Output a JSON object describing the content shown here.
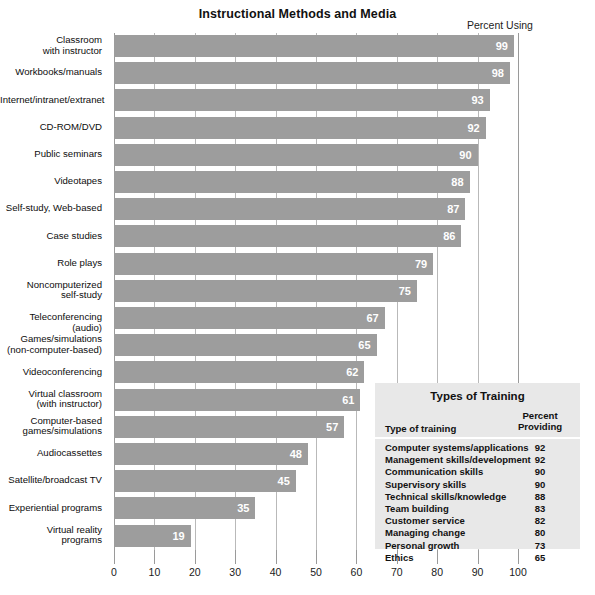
{
  "chart_data": {
    "type": "bar",
    "orientation": "horizontal",
    "title": "Instructional Methods and Media",
    "axis_note": "Percent Using",
    "xlabel": "",
    "ylabel": "",
    "xlim": [
      0,
      100
    ],
    "xticks": [
      0,
      10,
      20,
      30,
      40,
      50,
      60,
      70,
      80,
      90,
      100
    ],
    "xtick_labels": [
      "0",
      "10",
      "20",
      "30",
      "40",
      "50",
      "60",
      "70",
      "80",
      "90",
      "100"
    ],
    "grid": "vertical",
    "legend_position": "inside-bottom-right",
    "bar_color": "#9d9d9d",
    "categories": [
      "Classroom\nwith instructor",
      "Workbooks/manuals",
      "Internet/intranet/extranet",
      "CD-ROM/DVD",
      "Public seminars",
      "Videotapes",
      "Self-study, Web-based",
      "Case studies",
      "Role plays",
      "Noncomputerized\nself-study",
      "Teleconferencing (audio)",
      "Games/simulations\n(non-computer-based)",
      "Videoconferencing",
      "Virtual classroom\n(with instructor)",
      "Computer-based\ngames/simulations",
      "Audiocassettes",
      "Satellite/broadcast TV",
      "Experiential programs",
      "Virtual reality\nprograms"
    ],
    "values": [
      99,
      98,
      93,
      92,
      90,
      88,
      87,
      86,
      79,
      75,
      67,
      65,
      62,
      61,
      57,
      48,
      45,
      35,
      19
    ]
  },
  "legend": {
    "title": "Types of Training",
    "header_left": "Type of training",
    "header_right": "Percent\nProviding",
    "header_right_line1": "Percent",
    "header_right_line2": "Providing",
    "rows": [
      {
        "name": "Computer systems/applications",
        "value": "92"
      },
      {
        "name": "Management skills/development",
        "value": "92"
      },
      {
        "name": "Communication skills",
        "value": "90"
      },
      {
        "name": "Supervisory skills",
        "value": "90"
      },
      {
        "name": "Technical skills/knowledge",
        "value": "88"
      },
      {
        "name": "Team building",
        "value": "83"
      },
      {
        "name": "Customer service",
        "value": "82"
      },
      {
        "name": "Managing change",
        "value": "80"
      },
      {
        "name": "Personal growth",
        "value": "73"
      },
      {
        "name": "Ethics",
        "value": "65"
      }
    ]
  },
  "colors": {
    "bar": "#9d9d9d",
    "gridline": "#b9b9b9",
    "axis": "#9a9a9a",
    "legend_background": "#e8e8e8",
    "text": "#111111",
    "bar_label": "#ffffff"
  }
}
